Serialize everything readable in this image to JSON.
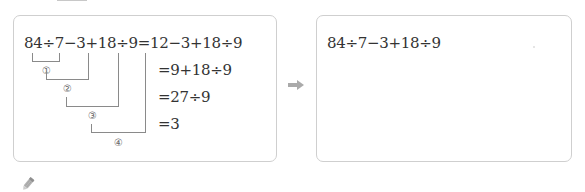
{
  "left_panel": {
    "expression": "84÷7−3+18÷9",
    "first_line": "84÷7−3+18÷9=12−3+18÷9",
    "steps": [
      "=9+18÷9",
      "=27÷9",
      "=3"
    ],
    "order_labels": [
      "①",
      "②",
      "③",
      "④"
    ]
  },
  "right_panel": {
    "expression": "84÷7−3+18÷9"
  },
  "icons": {
    "arrow": "right-arrow-icon",
    "pencil": "pencil-icon"
  },
  "colors": {
    "border": "#cfcfcf",
    "text": "#333333",
    "bracket": "#8a8a8a",
    "arrow": "#aaaaaa"
  }
}
